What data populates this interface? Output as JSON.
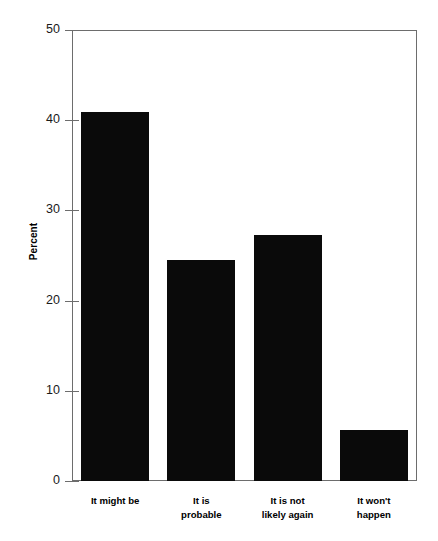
{
  "chart_data": {
    "type": "bar",
    "title": "",
    "xlabel": "",
    "ylabel": "Percent",
    "categories": [
      "It might be",
      "It is probable",
      "It is not likely again",
      "It won't happen"
    ],
    "category_lines": [
      [
        "It might be"
      ],
      [
        "It is",
        "probable"
      ],
      [
        "It is not",
        "likely again"
      ],
      [
        "It won't",
        "happen"
      ]
    ],
    "values": [
      40.9,
      24.5,
      27.3,
      5.7
    ],
    "ylim": [
      0,
      50
    ],
    "yticks": [
      0,
      10,
      20,
      30,
      40,
      50
    ],
    "ytick_labels": [
      "0",
      "10",
      "20",
      "30",
      "40",
      "50"
    ],
    "grid": false,
    "legend": "none",
    "bar_color": "#0a0a0a",
    "frame_color": "#6d6d6d",
    "background": "#ffffff"
  }
}
